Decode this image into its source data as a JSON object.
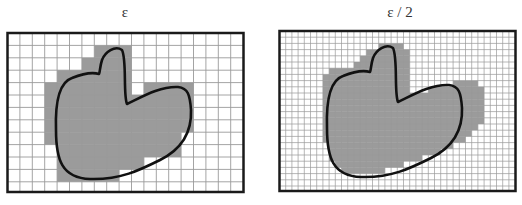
{
  "panels": [
    {
      "label": "ε",
      "frame": {
        "x": 7.5,
        "y": 33,
        "w": 236,
        "h": 159
      },
      "cell": 12.4,
      "cols": 19,
      "rows": 13,
      "shaded_rows": [
        [
          1,
          7,
          9
        ],
        [
          2,
          6,
          9
        ],
        [
          3,
          4,
          9
        ],
        [
          4,
          3,
          9
        ],
        [
          4,
          11,
          14
        ],
        [
          5,
          3,
          14
        ],
        [
          6,
          3,
          14
        ],
        [
          7,
          3,
          14
        ],
        [
          8,
          3,
          13
        ],
        [
          9,
          4,
          13
        ],
        [
          10,
          4,
          10
        ],
        [
          11,
          4,
          8
        ]
      ],
      "blob_offset": [
        0,
        0
      ]
    },
    {
      "label": "ε / 2",
      "frame": {
        "x": 279.5,
        "y": 31,
        "w": 236,
        "h": 160
      },
      "cell": 6.2,
      "cols": 38,
      "rows": 26,
      "shaded_rows": [
        [
          2,
          16,
          19
        ],
        [
          3,
          14,
          20
        ],
        [
          4,
          13,
          20
        ],
        [
          5,
          12,
          20
        ],
        [
          6,
          8,
          20
        ],
        [
          7,
          7,
          20
        ],
        [
          8,
          7,
          20
        ],
        [
          8,
          28,
          31
        ],
        [
          9,
          7,
          20
        ],
        [
          9,
          24,
          32
        ],
        [
          10,
          7,
          32
        ],
        [
          11,
          7,
          32
        ],
        [
          12,
          7,
          32
        ],
        [
          13,
          7,
          32
        ],
        [
          14,
          7,
          32
        ],
        [
          15,
          7,
          31
        ],
        [
          16,
          7,
          30
        ],
        [
          17,
          7,
          29
        ],
        [
          18,
          8,
          27
        ],
        [
          19,
          8,
          25
        ],
        [
          20,
          8,
          22
        ],
        [
          21,
          9,
          19
        ],
        [
          22,
          10,
          16
        ]
      ],
      "blob_offset": [
        271,
        -2
      ]
    }
  ],
  "colors": {
    "frame": "#1a1a1a",
    "grid": "#9a9a9a",
    "shade": "#9b9b9b",
    "outline": "#111111"
  }
}
